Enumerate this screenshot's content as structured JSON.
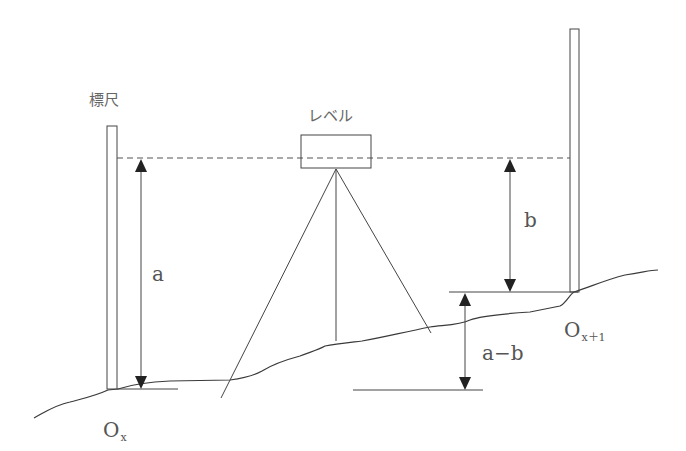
{
  "diagram": {
    "labels": {
      "staff": "標尺",
      "level": "レベル",
      "a": "a",
      "b": "b",
      "a_minus_b": "a−b",
      "point_left_main": "O",
      "point_left_sub": "x",
      "point_right_main": "O",
      "point_right_sub": "x＋1"
    },
    "colors": {
      "line": "#3a3a3a",
      "text": "#555555",
      "background": "#ffffff"
    }
  }
}
